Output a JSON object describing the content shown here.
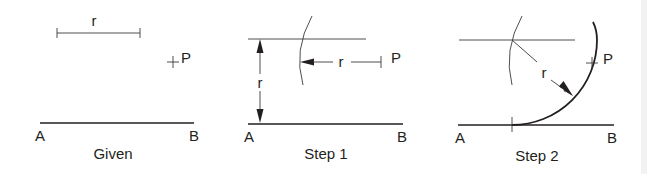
{
  "panels": [
    {
      "caption": "Given",
      "labels": {
        "radius": "r",
        "point": "P",
        "line_start": "A",
        "line_end": "B"
      }
    },
    {
      "caption": "Step 1",
      "labels": {
        "radius_vertical": "r",
        "radius_horizontal": "r",
        "point": "P",
        "line_start": "A",
        "line_end": "B"
      }
    },
    {
      "caption": "Step 2",
      "labels": {
        "radius": "r",
        "point": "P",
        "line_start": "A",
        "line_end": "B"
      }
    }
  ],
  "colors": {
    "ink": "#231f20",
    "background": "#ffffff"
  }
}
